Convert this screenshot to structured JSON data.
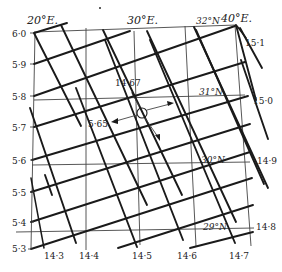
{
  "diagram": {
    "type": "map-graticule-with-isolines",
    "meridian_labels": [
      "20°E.",
      "30°E.",
      "40°E."
    ],
    "parallel_labels": [
      "32°N",
      "31°N",
      "30°N",
      "29°N"
    ],
    "left_scale_labels": [
      "6·0",
      "5·9",
      "5·8",
      "5·7",
      "5·6",
      "5·5",
      "5·4",
      "5·3"
    ],
    "bottom_scale_labels": [
      "14·3",
      "14·4",
      "14·5",
      "14·6",
      "14·7"
    ],
    "right_scale_labels": [
      "15·1",
      "15·0",
      "14·9",
      "14·8"
    ],
    "point": {
      "label_x": "14·67",
      "label_y": "5·65",
      "marker": "circle-with-arrows"
    },
    "colors": {
      "background": "#ffffff",
      "ink": "#1a1a1a"
    }
  }
}
